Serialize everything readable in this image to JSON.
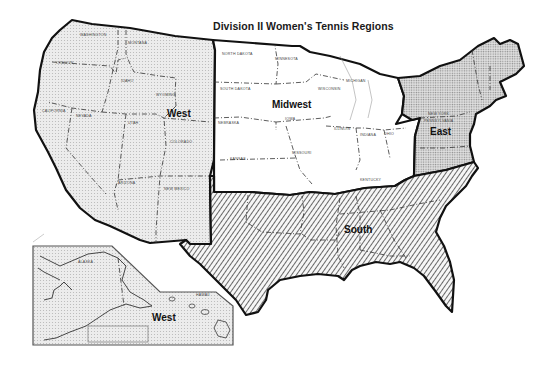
{
  "title": "Division II Women's Tennis Regions",
  "legend_colors": {
    "west": "#e6e6e6",
    "midwest": "#ffffff",
    "east": "#d2d2d2",
    "south": "hatched #222 on #fafafa",
    "border": "#111111"
  },
  "regions": {
    "west": {
      "label": "West",
      "states": [
        "Washington",
        "Idaho",
        "Montana",
        "Oregon",
        "Wyoming",
        "California",
        "Nevada",
        "Utah",
        "Colorado",
        "Arizona",
        "New Mexico"
      ]
    },
    "midwest": {
      "label": "Midwest",
      "states": [
        "North Dakota",
        "Minnesota",
        "South Dakota",
        "Wisconsin",
        "Michigan",
        "Nebraska",
        "Iowa",
        "Illinois",
        "Indiana",
        "Ohio",
        "Kansas",
        "Missouri",
        "Kentucky"
      ]
    },
    "east": {
      "label": "East",
      "states": [
        "New York",
        "Pennsylvania"
      ]
    },
    "south": {
      "label": "South",
      "states": []
    },
    "inset": {
      "label": "West",
      "states": [
        "Alaska",
        "Hawaii"
      ]
    }
  },
  "state_labels": {
    "washington": "WASHINGTON",
    "montana": "MONTANA",
    "oregon": "OREGON",
    "idaho": "IDAHO",
    "wyoming": "WYOMING",
    "california": "CALIFORNIA",
    "nevada": "NEVADA",
    "utah": "UTAH",
    "colorado": "COLORADO",
    "arizona": "ARIZONA",
    "new_mexico": "NEW MEXICO",
    "north_dakota": "NORTH DAKOTA",
    "minnesota": "MINNESOTA",
    "south_dakota": "SOUTH DAKOTA",
    "wisconsin": "WISCONSIN",
    "michigan": "MICHIGAN",
    "nebraska": "NEBRASKA",
    "iowa": "IOWA",
    "illinois": "ILLINOIS",
    "indiana": "INDIANA",
    "ohio": "OHIO",
    "kansas": "KANSAS",
    "missouri": "MISSOURI",
    "kentucky": "KENTUCKY",
    "new_york": "NEW YORK",
    "pennsylvania": "PENNSYLVANIA",
    "alaska": "ALASKA",
    "hawaii": "HAWAII"
  }
}
